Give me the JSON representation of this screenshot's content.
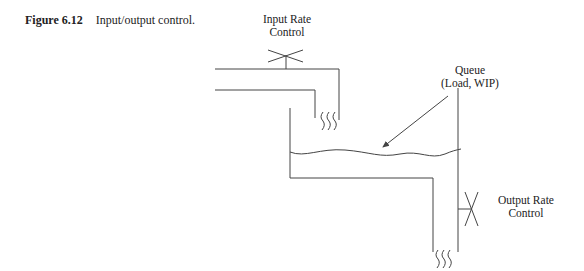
{
  "figure": {
    "number": "Figure 6.12",
    "title": "Input/output control."
  },
  "labels": {
    "input_rate_line1": "Input Rate",
    "input_rate_line2": "Control",
    "queue_line1": "Queue",
    "queue_line2": "(Load, WIP)",
    "output_rate_line1": "Output Rate",
    "output_rate_line2": "Control"
  },
  "colors": {
    "line": "#444444",
    "text": "#222222",
    "background": "#ffffff"
  }
}
